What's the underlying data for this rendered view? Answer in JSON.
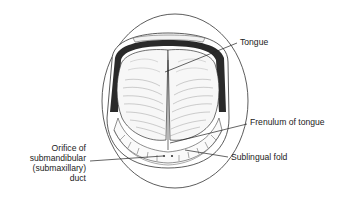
{
  "diagram": {
    "labels": {
      "tongue": "Tongue",
      "frenulum": "Frenulum of tongue",
      "sublingual_fold": "Sublingual fold",
      "orifice": {
        "line1": "Orifice of",
        "line2": "submandibular",
        "line3": "(submaxillary)",
        "line4": "duct"
      }
    },
    "colors": {
      "ink": "#222222",
      "gum_band": "#2a2a2a",
      "background": "#ffffff"
    }
  }
}
